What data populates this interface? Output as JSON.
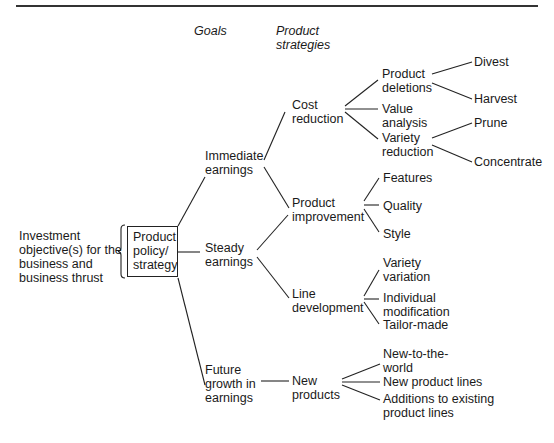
{
  "headers": {
    "goals": "Goals",
    "product_strategies": "Product\nstrategies"
  },
  "root": {
    "label": "Investment\nobjective(s) for the\nbusiness and\nbusiness thrust"
  },
  "policy_box": {
    "label": "Product\npolicy/\nstrategy"
  },
  "goals": [
    {
      "label": "Immediate\nearnings"
    },
    {
      "label": "Steady\nearnings"
    },
    {
      "label": "Future\ngrowth in\nearnings"
    }
  ],
  "strategies": [
    {
      "label": "Cost\nreduction"
    },
    {
      "label": "Product\nimprovement"
    },
    {
      "label": "Line\ndevelopment"
    },
    {
      "label": "New\nproducts"
    }
  ],
  "tactics": {
    "cost_reduction": [
      {
        "label": "Product\ndeletions"
      },
      {
        "label": "Value\nanalysis"
      },
      {
        "label": "Variety\nreduction"
      }
    ],
    "product_improvement": [
      {
        "label": "Features"
      },
      {
        "label": "Quality"
      },
      {
        "label": "Style"
      }
    ],
    "line_development": [
      {
        "label": "Variety\nvariation"
      },
      {
        "label": "Individual\nmodification"
      },
      {
        "label": "Tailor-made"
      }
    ],
    "new_products": [
      {
        "label": "New-to-the-\nworld"
      },
      {
        "label": "New product lines"
      },
      {
        "label": "Additions to existing\nproduct lines"
      }
    ]
  },
  "actions": {
    "product_deletions": [
      {
        "label": "Divest"
      },
      {
        "label": "Harvest"
      }
    ],
    "variety_reduction": [
      {
        "label": "Prune"
      },
      {
        "label": "Concentrate"
      }
    ]
  }
}
